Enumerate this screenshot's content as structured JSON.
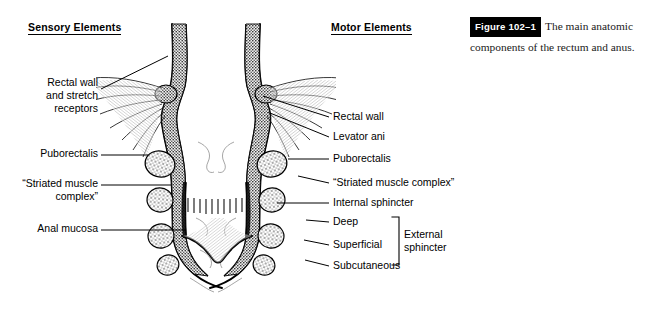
{
  "figure": {
    "caption_tag": "Figure 102–1",
    "caption_text": "The main anatomic components of the rectum and anus."
  },
  "headings": {
    "sensory": "Sensory Elements",
    "motor": "Motor Elements"
  },
  "labels": {
    "left": [
      {
        "id": "rectal-wall-stretch",
        "text": "Rectal wall\nand stretch\nreceptors"
      },
      {
        "id": "puborectalis",
        "text": "Puborectalis"
      },
      {
        "id": "striated-muscle-complex",
        "text": "“Striated muscle\ncomplex”"
      },
      {
        "id": "anal-mucosa",
        "text": "Anal mucosa"
      }
    ],
    "right": [
      {
        "id": "rectal-wall",
        "text": "Rectal wall"
      },
      {
        "id": "levator-ani",
        "text": "Levator ani"
      },
      {
        "id": "puborectalis",
        "text": "Puborectalis"
      },
      {
        "id": "striated-muscle-complex",
        "text": "“Striated muscle complex”"
      },
      {
        "id": "internal-sphincter",
        "text": "Internal sphincter"
      },
      {
        "id": "deep",
        "text": "Deep"
      },
      {
        "id": "superficial",
        "text": "Superficial"
      },
      {
        "id": "subcutaneous",
        "text": "Subcutaneous"
      }
    ],
    "bracket_group": "External\nsphincter"
  },
  "illustration": {
    "name": "rectum-anus-cross-section",
    "description": "Paired mirrored sagittal engravings of the rectum and anal canal"
  },
  "colors": {
    "background": "#ffffff",
    "ink": "#000000",
    "caption_text": "#1a1a1a",
    "tag_background": "#000000",
    "tag_text": "#ffffff"
  }
}
